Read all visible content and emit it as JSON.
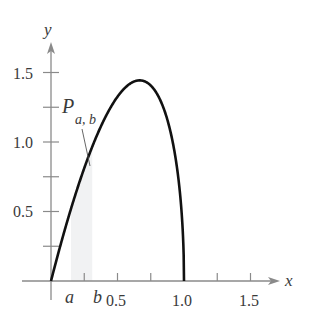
{
  "chart_data": {
    "type": "line",
    "title": "",
    "function": "f(x) = (15/4) x sqrt(1 - x)",
    "xlabel": "x",
    "ylabel": "y",
    "xlim": [
      0,
      1.6
    ],
    "ylim": [
      0,
      1.6
    ],
    "x_ticks": [
      0.25,
      0.5,
      0.75,
      1.0,
      1.25,
      1.5
    ],
    "x_tick_labels": [
      {
        "value": 0.5,
        "label": "0.5"
      },
      {
        "value": 1.0,
        "label": "1.0"
      },
      {
        "value": 1.5,
        "label": "1.5"
      }
    ],
    "y_ticks": [
      0.25,
      0.5,
      0.75,
      1.0,
      1.25,
      1.5
    ],
    "y_tick_labels": [
      {
        "value": 0.5,
        "label": "0.5"
      },
      {
        "value": 1.0,
        "label": "1.0"
      },
      {
        "value": 1.5,
        "label": "1.5"
      }
    ],
    "series": [
      {
        "name": "curve",
        "x": [
          0,
          0.1,
          0.2,
          0.3,
          0.4,
          0.5,
          0.6,
          0.667,
          0.7,
          0.8,
          0.9,
          0.95,
          1.0
        ],
        "y": [
          0,
          0.356,
          0.671,
          0.941,
          1.162,
          1.326,
          1.423,
          1.443,
          1.438,
          1.342,
          1.067,
          0.796,
          0
        ]
      }
    ],
    "shaded_region": {
      "from": 0.15,
      "to": 0.31,
      "label_main": "P",
      "label_sub": "a, b"
    },
    "annotations": [
      {
        "text": "a",
        "x": 0.15
      },
      {
        "text": "b",
        "x": 0.31
      }
    ],
    "grid": false,
    "legend": "none"
  },
  "labels": {
    "x_axis": "x",
    "y_axis": "y",
    "a": "a",
    "b": "b",
    "P": "P",
    "P_sub": "a, b",
    "xt05": "0.5",
    "xt10": "1.0",
    "xt15": "1.5",
    "yt05": "0.5",
    "yt10": "1.0",
    "yt15": "1.5"
  },
  "colors": {
    "curve": "#111111",
    "axis": "#8a8a8a",
    "shade": "#f1f2f3",
    "text": "#3a3a3a"
  }
}
